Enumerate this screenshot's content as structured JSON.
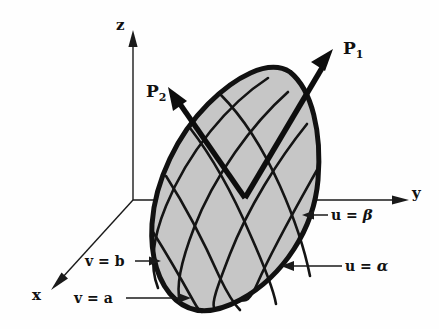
{
  "figure": {
    "background_color": "#fefefe",
    "surface_fill_color": "#c6c6c6",
    "ink_color": "#111111"
  },
  "axes": [
    {
      "name": "z-axis",
      "label": "z",
      "direction": "up"
    },
    {
      "name": "y-axis",
      "label": "y",
      "direction": "right"
    },
    {
      "name": "x-axis",
      "label": "x",
      "direction": "down-left"
    }
  ],
  "vectors": [
    {
      "name": "P1",
      "label": "P",
      "subscript": "1",
      "direction": "up-right"
    },
    {
      "name": "P2",
      "label": "P",
      "subscript": "2",
      "direction": "up-left"
    }
  ],
  "callouts": [
    {
      "name": "u-beta",
      "text_prefix": "u = ",
      "symbol": "β",
      "arrow_direction": "left"
    },
    {
      "name": "u-alpha",
      "text_prefix": "u = ",
      "symbol": "α",
      "arrow_direction": "left"
    },
    {
      "name": "v-b",
      "text_prefix": "v = ",
      "symbol": "b",
      "arrow_direction": "right"
    },
    {
      "name": "v-a",
      "text_prefix": "v = ",
      "symbol": "a",
      "arrow_direction": "right"
    }
  ],
  "geometry": {
    "origin": [
      133,
      200
    ],
    "z_axis": {
      "from": [
        133,
        200
      ],
      "to": [
        133,
        38
      ]
    },
    "y_axis": {
      "from": [
        133,
        200
      ],
      "to": [
        404,
        200
      ]
    },
    "x_axis": {
      "from": [
        133,
        200
      ],
      "to": [
        56,
        285
      ]
    },
    "surface_outline_path": "M 290 72 C 312 90 322 132 318 180 C 314 228 284 276 240 300 C 214 314 192 314 176 300 C 158 284 150 256 152 224 C 155 180 178 134 208 104 C 234 78 268 58 290 72 Z",
    "u_curves": [
      "M 268 78 C 228 104 188 152 166 206 C 152 240 150 268 158 288",
      "M 288 92 C 252 124 214 176 194 228 C 180 264 176 288 180 302",
      "M 307 124 C 278 160 248 208 230 254 C 216 290 212 302 214 308",
      "M 317 170 C 298 204 274 246 258 282 C 248 304 244 300 241 300"
    ],
    "v_curves": [
      "M 220 94 C 240 114 262 146 280 186 C 296 222 306 256 310 276",
      "M 190 128 C 210 154 232 192 250 234 C 266 270 274 292 276 304",
      "M 166 176 C 184 204 204 242 220 278 C 232 302 238 308 240 310",
      "M 153 232 C 168 256 184 284 194 302 C 200 312 202 312 202 312"
    ],
    "p1_vector": {
      "from": [
        245,
        198
      ],
      "to": [
        333,
        50
      ]
    },
    "p2_vector": {
      "from": [
        245,
        198
      ],
      "to": [
        169,
        88
      ]
    },
    "callout_arrows": [
      {
        "name": "u-beta-arrow",
        "from": [
          328,
          215
        ],
        "to": [
          305,
          215
        ]
      },
      {
        "name": "u-alpha-arrow",
        "from": [
          342,
          266
        ],
        "to": [
          284,
          266
        ]
      },
      {
        "name": "v-b-arrow",
        "from": [
          136,
          261
        ],
        "to": [
          158,
          261
        ]
      },
      {
        "name": "v-a-arrow",
        "from": [
          126,
          298
        ],
        "to": [
          188,
          298
        ]
      }
    ]
  }
}
